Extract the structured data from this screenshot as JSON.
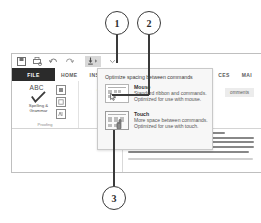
{
  "callouts": [
    {
      "id": "callout-1",
      "label": "1"
    },
    {
      "id": "callout-2",
      "label": "2"
    },
    {
      "id": "callout-3",
      "label": "3"
    }
  ],
  "window": {
    "quick_access": {
      "items": [
        {
          "name": "save-icon",
          "label": "Save"
        },
        {
          "name": "print-preview-icon",
          "label": "Print Preview and Print"
        },
        {
          "name": "undo-icon",
          "label": "Undo"
        },
        {
          "name": "redo-icon",
          "label": "Redo"
        },
        {
          "name": "touch-mouse-mode-icon",
          "label": "Touch/Mouse Mode"
        },
        {
          "name": "customize-quick-access-toolbar-icon",
          "label": "Customize Quick Access Toolbar"
        }
      ]
    },
    "tabs": [
      {
        "label": "FILE",
        "active": true
      },
      {
        "label": "HOME",
        "active": false
      },
      {
        "label": "INSER",
        "active": false
      },
      {
        "label": "CES",
        "active": false
      },
      {
        "label": "MAI",
        "active": false
      }
    ],
    "ribbon": {
      "groups": [
        {
          "label": "Proofing",
          "big_button": {
            "caption": "Spelling &\nGrammar",
            "icon_text": "ABC"
          },
          "small_buttons": [
            "define-icon",
            "thesaurus-icon",
            "word-count-icon"
          ]
        },
        {
          "label": "Lang",
          "big_button": {
            "caption": "Translate",
            "icon_text": "aあ"
          },
          "small_buttons": []
        }
      ],
      "comments_button": "omments"
    }
  },
  "dropdown": {
    "title": "Optimize spacing between commands",
    "options": [
      {
        "name": "mouse",
        "title": "Mouse",
        "desc_line1": "Standard ribbon and commands.",
        "desc_line2": "Optimized for use with mouse."
      },
      {
        "name": "touch",
        "title": "Touch",
        "desc_line1": "More space between commands.",
        "desc_line2": "Optimized for use with touch."
      }
    ]
  },
  "colors": {
    "accent": "#2b2b2b",
    "panel_bg": "#f7f7f7",
    "border": "#c9c9c9",
    "callout_stroke": "#3a3a3a"
  }
}
